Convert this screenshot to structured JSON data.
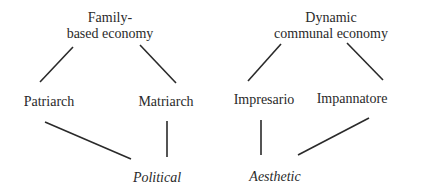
{
  "diagram": {
    "left_root": {
      "line1": "Family-",
      "line2": "based economy"
    },
    "right_root": {
      "line1": "Dynamic",
      "line2": "communal economy"
    },
    "nodes": {
      "patriarch": "Patriarch",
      "matriarch": "Matriarch",
      "impresario": "Impresario",
      "impannatore": "Impannatore"
    },
    "outcomes": {
      "political": "Political",
      "aesthetic": "Aesthetic"
    },
    "edges": [
      [
        "Family-based economy",
        "Patriarch"
      ],
      [
        "Family-based economy",
        "Matriarch"
      ],
      [
        "Dynamic communal economy",
        "Impresario"
      ],
      [
        "Dynamic communal economy",
        "Impannatore"
      ],
      [
        "Patriarch",
        "Political"
      ],
      [
        "Matriarch",
        "Political"
      ],
      [
        "Impresario",
        "Aesthetic"
      ],
      [
        "Impannatore",
        "Aesthetic"
      ]
    ]
  }
}
